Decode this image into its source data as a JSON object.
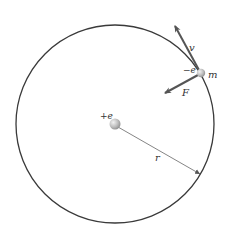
{
  "diagram": {
    "type": "bohr-atom-orbit",
    "orbit": {
      "cx": 115,
      "cy": 124,
      "r": 99,
      "color": "#3a3a3a"
    },
    "nucleus": {
      "label": "+e",
      "x": 115,
      "y": 124,
      "color": "#b8b8b8"
    },
    "electron": {
      "charge_label": "−e",
      "mass_label": "m",
      "x": 201,
      "y": 73,
      "color": "#c4c4c4"
    },
    "velocity": {
      "label": "v",
      "color": "#555555"
    },
    "force": {
      "label": "F",
      "color": "#555555"
    },
    "radius": {
      "label": "r",
      "color": "#555555"
    }
  }
}
